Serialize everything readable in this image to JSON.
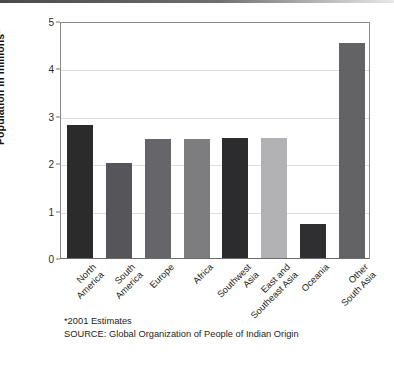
{
  "chart_data": {
    "type": "bar",
    "title": "",
    "subtitle": "",
    "xlabel": "",
    "ylabel": "Population in millions*",
    "ylim": [
      0,
      5
    ],
    "yticks": [
      0,
      1,
      2,
      3,
      4,
      5
    ],
    "ytick_labels": [
      "0",
      "1",
      "2",
      "3",
      "4",
      "5"
    ],
    "grid": "horizontal",
    "legend": "none",
    "categories": [
      "North America",
      "South America",
      "Europe",
      "Africa",
      "Southwest Asia",
      "East and Southeast Asia",
      "Oceania",
      "Other South Asia"
    ],
    "category_lines": [
      [
        "North",
        "America"
      ],
      [
        "South",
        "America"
      ],
      [
        "Europe"
      ],
      [
        "Africa"
      ],
      [
        "Southwest",
        "Asia"
      ],
      [
        "East and",
        "Southeast Asia"
      ],
      [
        "Oceania"
      ],
      [
        "Other",
        "South Asia"
      ]
    ],
    "values": [
      2.81,
      2.01,
      2.52,
      2.52,
      2.53,
      2.53,
      0.72,
      4.53
    ],
    "bar_colors": [
      "#2b2b2b",
      "#56565a",
      "#66666a",
      "#7d7d80",
      "#2c2c2e",
      "#b2b2b4",
      "#2f2f31",
      "#636366"
    ],
    "annotations": [
      "*2001 Estimates",
      "SOURCE: Global Organization of People of Indian Origin"
    ]
  },
  "footnotes": {
    "estimates_note": "*2001 Estimates",
    "source_note": "SOURCE: Global Organization of People of Indian Origin"
  },
  "colors": {
    "background": "#ffffff",
    "axis": "#8a8a8a",
    "gridline": "#dcdcdc",
    "text": "#1a1a1a",
    "top_rule": "#5a5a5a"
  }
}
